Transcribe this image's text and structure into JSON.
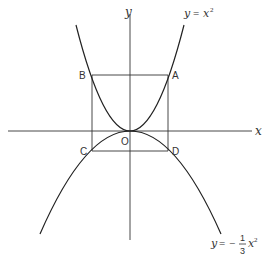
{
  "diagram": {
    "axes": {
      "x_label": "x",
      "y_label": "y",
      "origin_label": "O"
    },
    "curves": {
      "upper": {
        "label_lhs": "y",
        "label_eq": "=",
        "label_rhs": "x",
        "label_exp": "2",
        "equation": "y = x^2"
      },
      "lower": {
        "label_lhs": "y",
        "label_eq": "=",
        "label_sign": "−",
        "label_num": "1",
        "label_den": "3",
        "label_var": "x",
        "label_exp": "2",
        "equation": "y = -1/3 x^2"
      }
    },
    "points": {
      "A": "A",
      "B": "B",
      "C": "C",
      "D": "D"
    },
    "colors": {
      "stroke": "#222222",
      "background": "#ffffff"
    }
  }
}
